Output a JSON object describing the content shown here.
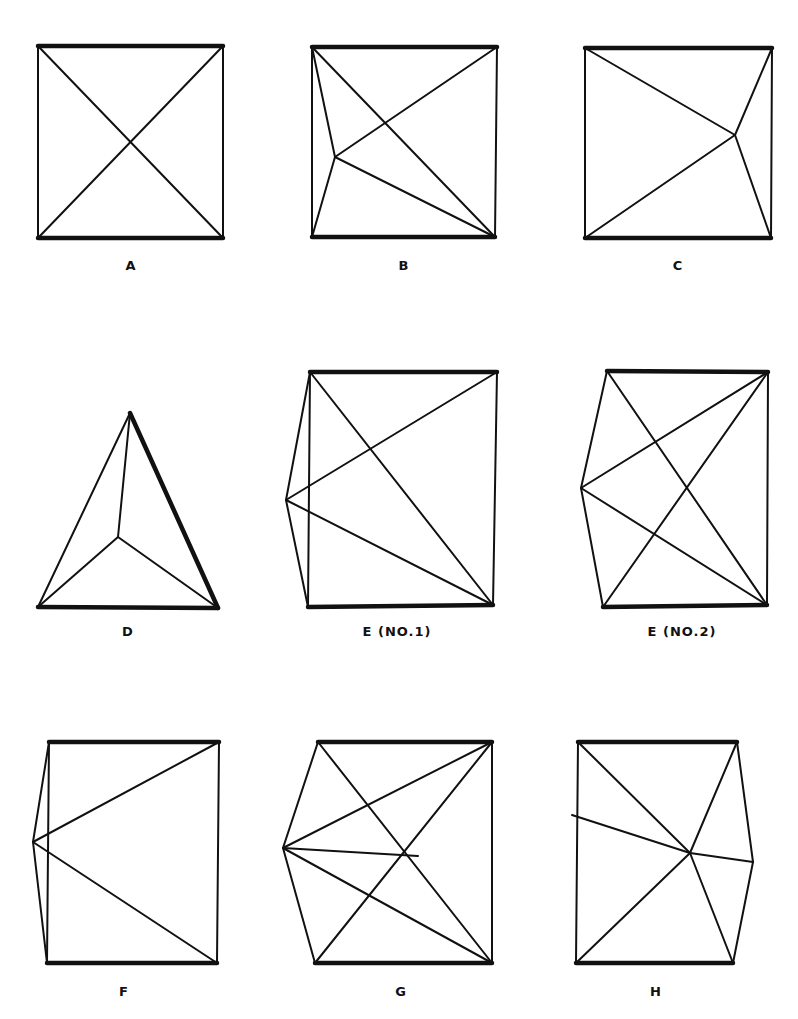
{
  "figures": [
    {
      "id": "A",
      "label": "A",
      "label_pos": [
        131,
        258
      ],
      "thick": [
        [
          38,
          46,
          223,
          46
        ],
        [
          38,
          238,
          223,
          238
        ]
      ],
      "thin": [
        [
          38,
          46,
          38,
          238
        ],
        [
          223,
          46,
          223,
          238
        ],
        [
          38,
          46,
          223,
          238
        ],
        [
          223,
          46,
          38,
          238
        ]
      ]
    },
    {
      "id": "B",
      "label": "B",
      "label_pos": [
        404,
        258
      ],
      "thick": [
        [
          312,
          47,
          497,
          47
        ],
        [
          312,
          237,
          495,
          237
        ]
      ],
      "thin": [
        [
          312,
          47,
          312,
          237
        ],
        [
          497,
          47,
          495,
          237
        ],
        [
          312,
          47,
          495,
          237
        ],
        [
          497,
          47,
          335,
          157
        ],
        [
          335,
          157,
          312,
          47
        ],
        [
          335,
          157,
          312,
          237
        ],
        [
          335,
          157,
          495,
          237
        ]
      ]
    },
    {
      "id": "C",
      "label": "C",
      "label_pos": [
        678,
        258
      ],
      "thick": [
        [
          585,
          48,
          772,
          48
        ],
        [
          585,
          238,
          771,
          238
        ]
      ],
      "thin": [
        [
          585,
          48,
          585,
          238
        ],
        [
          772,
          48,
          771,
          238
        ],
        [
          585,
          48,
          735,
          135
        ],
        [
          772,
          48,
          735,
          135
        ],
        [
          585,
          238,
          735,
          135
        ],
        [
          771,
          238,
          735,
          135
        ]
      ]
    },
    {
      "id": "D",
      "label": "D",
      "label_pos": [
        128,
        624
      ],
      "thick": [
        [
          130,
          413,
          218,
          608
        ],
        [
          38,
          607,
          218,
          608
        ]
      ],
      "thin": [
        [
          130,
          413,
          38,
          607
        ],
        [
          130,
          413,
          118,
          537
        ],
        [
          118,
          537,
          38,
          607
        ],
        [
          118,
          537,
          218,
          608
        ]
      ]
    },
    {
      "id": "E1",
      "label": "E (NO.1)",
      "label_pos": [
        397,
        624
      ],
      "thick": [
        [
          310,
          372,
          497,
          372
        ],
        [
          308,
          607,
          493,
          605
        ]
      ],
      "thin": [
        [
          310,
          372,
          308,
          607
        ],
        [
          497,
          372,
          493,
          605
        ],
        [
          310,
          372,
          493,
          605
        ],
        [
          286,
          500,
          310,
          372
        ],
        [
          286,
          500,
          308,
          607
        ],
        [
          286,
          500,
          497,
          372
        ],
        [
          286,
          500,
          493,
          605
        ]
      ]
    },
    {
      "id": "E2",
      "label": "E (NO.2)",
      "label_pos": [
        682,
        624
      ],
      "thick": [
        [
          607,
          371,
          768,
          372
        ],
        [
          603,
          607,
          767,
          605
        ]
      ],
      "thin": [
        [
          768,
          372,
          767,
          605
        ],
        [
          581,
          488,
          607,
          371
        ],
        [
          581,
          488,
          603,
          607
        ],
        [
          581,
          488,
          768,
          372
        ],
        [
          581,
          488,
          767,
          605
        ],
        [
          607,
          371,
          767,
          605
        ],
        [
          768,
          372,
          603,
          607
        ]
      ]
    },
    {
      "id": "F",
      "label": "F",
      "label_pos": [
        124,
        984
      ],
      "thick": [
        [
          49,
          742,
          219,
          742
        ],
        [
          47,
          963,
          217,
          963
        ]
      ],
      "thin": [
        [
          49,
          742,
          47,
          963
        ],
        [
          219,
          742,
          217,
          963
        ],
        [
          33,
          842,
          49,
          742
        ],
        [
          33,
          842,
          47,
          963
        ],
        [
          33,
          842,
          219,
          742
        ],
        [
          33,
          842,
          217,
          963
        ]
      ]
    },
    {
      "id": "G",
      "label": "G",
      "label_pos": [
        401,
        984
      ],
      "thick": [
        [
          318,
          742,
          492,
          742
        ],
        [
          315,
          963,
          492,
          963
        ]
      ],
      "thin": [
        [
          492,
          742,
          492,
          963
        ],
        [
          283,
          848,
          318,
          742
        ],
        [
          283,
          848,
          315,
          963
        ],
        [
          283,
          848,
          492,
          742
        ],
        [
          283,
          848,
          492,
          963
        ],
        [
          283,
          848,
          418,
          856
        ],
        [
          318,
          742,
          492,
          963
        ],
        [
          315,
          963,
          492,
          742
        ]
      ]
    },
    {
      "id": "H",
      "label": "H",
      "label_pos": [
        656,
        984
      ],
      "thick": [
        [
          578,
          742,
          737,
          742
        ],
        [
          576,
          963,
          733,
          963
        ]
      ],
      "thin": [
        [
          578,
          742,
          576,
          963
        ],
        [
          737,
          742,
          753,
          862
        ],
        [
          753,
          862,
          733,
          963
        ],
        [
          572,
          815,
          690,
          853
        ],
        [
          690,
          853,
          753,
          862
        ],
        [
          578,
          742,
          690,
          853
        ],
        [
          737,
          742,
          690,
          853
        ],
        [
          576,
          963,
          690,
          853
        ],
        [
          733,
          963,
          690,
          853
        ]
      ]
    }
  ]
}
